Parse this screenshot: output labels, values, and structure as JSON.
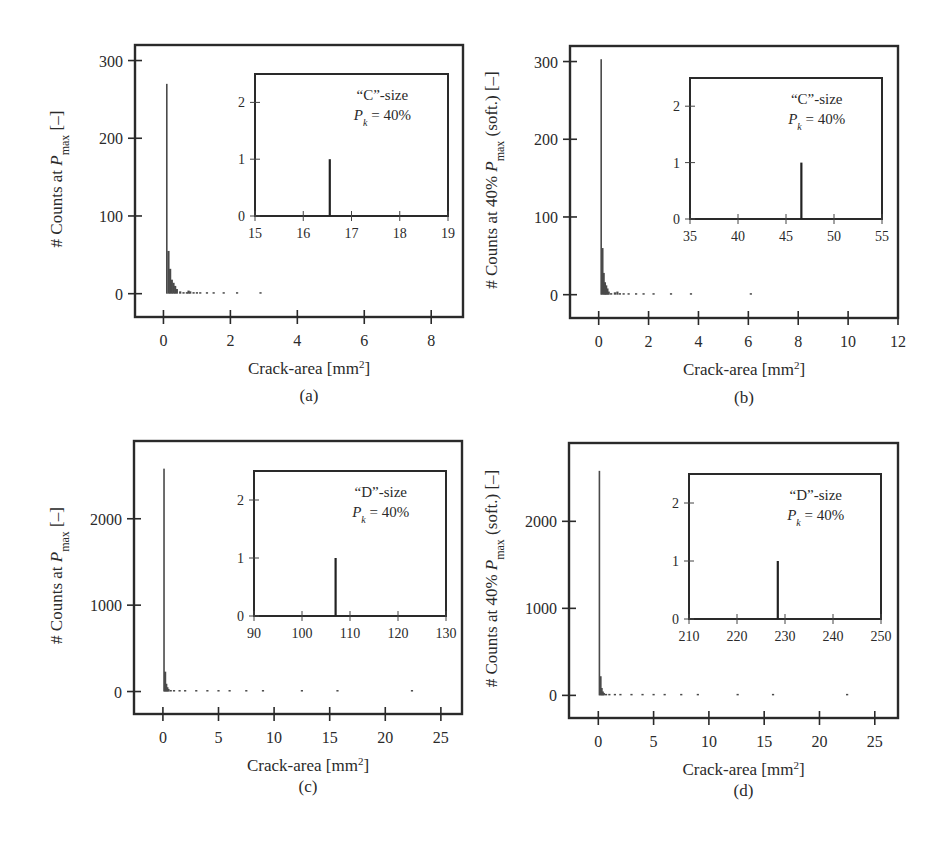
{
  "figure": {
    "panels": [
      {
        "id": "a",
        "caption": "(a)"
      },
      {
        "id": "b",
        "caption": "(b)"
      },
      {
        "id": "c",
        "caption": "(c)"
      },
      {
        "id": "d",
        "caption": "(d)"
      }
    ]
  },
  "chart_data": [
    {
      "panel": "(a)",
      "type": "bar",
      "title": "",
      "xlabel": "Crack-area [mm²]",
      "ylabel": "# Counts at P_max [–]",
      "ylabel_parts": {
        "prefix": "# Counts at ",
        "var": "P",
        "sub": "max",
        "suffix": " [–]"
      },
      "xlim": [
        -0.85,
        8.95
      ],
      "ylim": [
        -30,
        320
      ],
      "xticks": [
        0,
        2,
        4,
        6,
        8
      ],
      "yticks": [
        0,
        100,
        200,
        300
      ],
      "grid": false,
      "x": [
        0.1,
        0.15,
        0.2,
        0.25,
        0.3,
        0.35,
        0.4,
        0.5,
        0.6,
        0.7,
        0.75,
        0.8,
        0.9,
        1.0,
        1.1,
        1.3,
        1.5,
        1.8,
        2.2,
        2.9
      ],
      "values": [
        270,
        55,
        32,
        18,
        14,
        10,
        6,
        3,
        2,
        2,
        4,
        3,
        2,
        2,
        1,
        1,
        1,
        1,
        1,
        1
      ],
      "inset": {
        "type": "bar",
        "label_line1": "“C”-size",
        "label_var": "P",
        "label_sub": "k",
        "label_rest": " = 40%",
        "xlim": [
          15,
          19
        ],
        "ylim": [
          0,
          2.5
        ],
        "xticks": [
          15,
          16,
          17,
          18,
          19
        ],
        "yticks": [
          0,
          1,
          2
        ],
        "x": [
          16.55
        ],
        "values": [
          1
        ]
      }
    },
    {
      "panel": "(b)",
      "type": "bar",
      "title": "",
      "xlabel": "Crack-area [mm²]",
      "ylabel": "# Counts at 40% P_max (soft.) [–]",
      "ylabel_parts": {
        "prefix": "# Counts at 40% ",
        "var": "P",
        "sub": "max",
        "suffix": " (soft.) [–]"
      },
      "xlim": [
        -1.15,
        12.0
      ],
      "ylim": [
        -30,
        320
      ],
      "xticks": [
        0,
        2,
        4,
        6,
        8,
        10,
        12
      ],
      "yticks": [
        0,
        100,
        200,
        300
      ],
      "grid": false,
      "x": [
        0.1,
        0.15,
        0.2,
        0.25,
        0.3,
        0.35,
        0.4,
        0.5,
        0.65,
        0.75,
        0.85,
        1.0,
        1.2,
        1.5,
        1.8,
        2.2,
        2.9,
        3.7,
        6.1
      ],
      "values": [
        303,
        60,
        28,
        16,
        12,
        8,
        4,
        2,
        3,
        4,
        2,
        1,
        1,
        1,
        1,
        1,
        1,
        1,
        1
      ],
      "inset": {
        "type": "bar",
        "label_line1": "“C”-size",
        "label_var": "P",
        "label_sub": "k",
        "label_rest": " = 40%",
        "xlim": [
          35,
          55
        ],
        "ylim": [
          0,
          2.5
        ],
        "xticks": [
          35,
          40,
          45,
          50,
          55
        ],
        "yticks": [
          0,
          1,
          2
        ],
        "x": [
          46.6
        ],
        "values": [
          1
        ]
      }
    },
    {
      "panel": "(c)",
      "type": "bar",
      "title": "",
      "xlabel": "Crack-area [mm²]",
      "ylabel": "# Counts at P_max [–]",
      "ylabel_parts": {
        "prefix": "# Counts at ",
        "var": "P",
        "sub": "max",
        "suffix": " [–]"
      },
      "xlim": [
        -2.6,
        26.9
      ],
      "ylim": [
        -260,
        2900
      ],
      "xticks": [
        0,
        5,
        10,
        15,
        20,
        25
      ],
      "yticks": [
        0,
        1000,
        2000
      ],
      "grid": false,
      "x": [
        0.1,
        0.2,
        0.3,
        0.4,
        0.5,
        0.7,
        1.0,
        1.5,
        2.0,
        3.0,
        4.0,
        5.0,
        6.0,
        7.5,
        9.0,
        12.5,
        15.7,
        22.4
      ],
      "values": [
        2580,
        230,
        90,
        50,
        30,
        18,
        10,
        6,
        4,
        3,
        2,
        2,
        1,
        1,
        1,
        1,
        1,
        1
      ],
      "inset": {
        "type": "bar",
        "label_line1": "“D”-size",
        "label_var": "P",
        "label_sub": "k",
        "label_rest": " = 40%",
        "xlim": [
          90,
          130
        ],
        "ylim": [
          0,
          2.5
        ],
        "xticks": [
          90,
          100,
          110,
          120,
          130
        ],
        "yticks": [
          0,
          1,
          2
        ],
        "x": [
          107
        ],
        "values": [
          1
        ]
      }
    },
    {
      "panel": "(d)",
      "type": "bar",
      "title": "",
      "xlabel": "Crack-area [mm²]",
      "ylabel": "# Counts at 40% P_max (soft.) [–]",
      "ylabel_parts": {
        "prefix": "# Counts at 40% ",
        "var": "P",
        "sub": "max",
        "suffix": " (soft.) [–]"
      },
      "xlim": [
        -2.65,
        27.1
      ],
      "ylim": [
        -260,
        2900
      ],
      "xticks": [
        0,
        5,
        10,
        15,
        20,
        25
      ],
      "yticks": [
        0,
        1000,
        2000
      ],
      "grid": false,
      "x": [
        0.1,
        0.2,
        0.3,
        0.4,
        0.5,
        0.7,
        1.0,
        1.5,
        2.0,
        3.0,
        4.0,
        5.0,
        6.0,
        7.5,
        9.0,
        12.6,
        15.8,
        22.5
      ],
      "values": [
        2580,
        220,
        85,
        45,
        28,
        16,
        9,
        5,
        4,
        3,
        2,
        2,
        1,
        1,
        1,
        1,
        1,
        1
      ],
      "inset": {
        "type": "bar",
        "label_line1": "“D”-size",
        "label_var": "P",
        "label_sub": "k",
        "label_rest": " = 40%",
        "xlim": [
          210,
          250
        ],
        "ylim": [
          0,
          2.5
        ],
        "xticks": [
          210,
          220,
          230,
          240,
          250
        ],
        "yticks": [
          0,
          1,
          2
        ],
        "x": [
          228.5
        ],
        "values": [
          1
        ]
      }
    }
  ]
}
